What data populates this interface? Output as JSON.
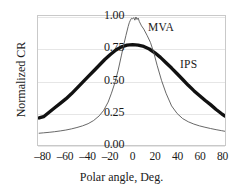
{
  "chart_data": {
    "type": "line",
    "title": "",
    "xlabel": "Polar angle, Deg.",
    "ylabel": "Normalized CR",
    "xlim": [
      -85,
      83
    ],
    "ylim": [
      0.0,
      1.05
    ],
    "xticks": [
      -80,
      -60,
      -40,
      -20,
      0,
      20,
      40,
      60,
      80
    ],
    "xtick_labels": [
      "–80",
      "–60",
      "–40",
      "–20",
      "0",
      "20",
      "40",
      "60",
      "80"
    ],
    "yticks": [
      0.0,
      0.25,
      0.5,
      0.75,
      1.0
    ],
    "ytick_labels": [
      "0.00",
      "0.25",
      "0.50",
      "0.75",
      "1.00"
    ],
    "grid": true,
    "grid_axis": "y",
    "legend_position": "inline-annotations",
    "series": [
      {
        "name": "MVA",
        "style": "thin-line",
        "color": "#555555",
        "linewidth": 0.9,
        "annotation": "MVA",
        "x": [
          -84,
          -80,
          -75,
          -70,
          -65,
          -60,
          -55,
          -50,
          -45,
          -40,
          -35,
          -30,
          -26,
          -22,
          -19,
          -16,
          -13,
          -10,
          -8,
          -6,
          -4,
          -3,
          -2,
          -1,
          0,
          1,
          2,
          3,
          4,
          5,
          6,
          8,
          10,
          13,
          16,
          19,
          22,
          26,
          30,
          35,
          40,
          45,
          50,
          55,
          60,
          65,
          70,
          75,
          80,
          83
        ],
        "y": [
          0.085,
          0.088,
          0.092,
          0.097,
          0.103,
          0.11,
          0.119,
          0.13,
          0.143,
          0.16,
          0.185,
          0.222,
          0.265,
          0.33,
          0.4,
          0.48,
          0.58,
          0.7,
          0.78,
          0.855,
          0.925,
          0.955,
          0.975,
          0.99,
          0.985,
          0.995,
          0.975,
          1.0,
          0.98,
          0.992,
          0.965,
          0.93,
          0.905,
          0.855,
          0.8,
          0.72,
          0.62,
          0.5,
          0.4,
          0.3,
          0.24,
          0.2,
          0.175,
          0.157,
          0.143,
          0.132,
          0.122,
          0.113,
          0.105,
          0.1
        ]
      },
      {
        "name": "IPS",
        "style": "thick-noisy-line",
        "color": "#111111",
        "linewidth": 3.4,
        "annotation": "IPS",
        "x": [
          -84,
          -80,
          -75,
          -70,
          -65,
          -60,
          -55,
          -50,
          -45,
          -40,
          -35,
          -30,
          -25,
          -20,
          -15,
          -10,
          -5,
          0,
          5,
          10,
          15,
          20,
          25,
          30,
          35,
          40,
          45,
          50,
          55,
          60,
          65,
          70,
          75,
          80,
          83
        ],
        "y": [
          0.205,
          0.215,
          0.25,
          0.285,
          0.32,
          0.355,
          0.395,
          0.44,
          0.485,
          0.53,
          0.575,
          0.62,
          0.665,
          0.705,
          0.74,
          0.765,
          0.778,
          0.782,
          0.778,
          0.768,
          0.748,
          0.718,
          0.682,
          0.64,
          0.598,
          0.553,
          0.508,
          0.462,
          0.42,
          0.382,
          0.345,
          0.31,
          0.272,
          0.238,
          0.22
        ]
      }
    ]
  }
}
